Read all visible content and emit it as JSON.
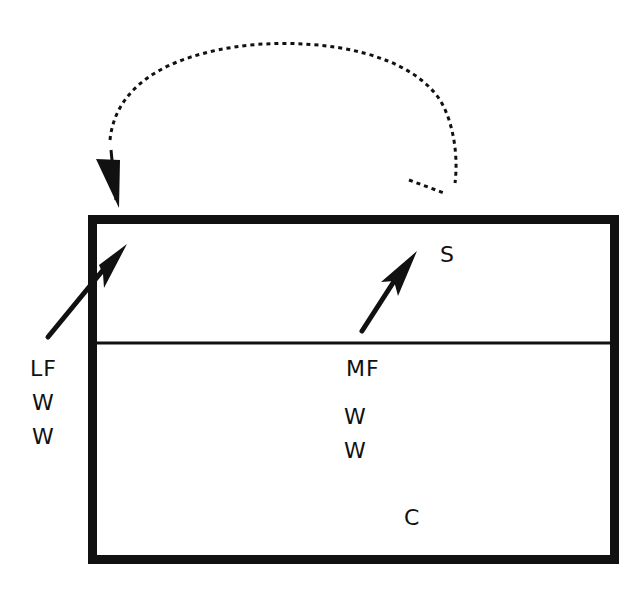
{
  "diagram": {
    "type": "volleyball-court-play",
    "colors": {
      "ink": "#111111",
      "background": "#ffffff"
    },
    "players": [
      {
        "id": "S",
        "label": "S",
        "x": 440,
        "y": 244
      },
      {
        "id": "LF",
        "label": "LF",
        "x": 30,
        "y": 358
      },
      {
        "id": "MF",
        "label": "MF",
        "x": 346,
        "y": 358
      },
      {
        "id": "W1-left",
        "label": "W",
        "x": 32,
        "y": 392
      },
      {
        "id": "W2-left",
        "label": "W",
        "x": 32,
        "y": 426
      },
      {
        "id": "W1-mid",
        "label": "W",
        "x": 344,
        "y": 406
      },
      {
        "id": "W2-mid",
        "label": "W",
        "x": 344,
        "y": 440
      },
      {
        "id": "C",
        "label": "C",
        "x": 404,
        "y": 507
      }
    ],
    "arrows": [
      {
        "name": "lf-move-arrow",
        "from": [
          48,
          337
        ],
        "to": [
          127,
          244
        ],
        "style": "solid"
      },
      {
        "name": "mf-move-arrow",
        "from": [
          362,
          331
        ],
        "to": [
          417,
          251
        ],
        "style": "solid"
      },
      {
        "name": "ball-path-arrow",
        "style": "dotted-curve"
      }
    ],
    "court": {
      "x": 88,
      "y": 215,
      "width": 531,
      "height": 349,
      "divider_y": 343
    }
  }
}
